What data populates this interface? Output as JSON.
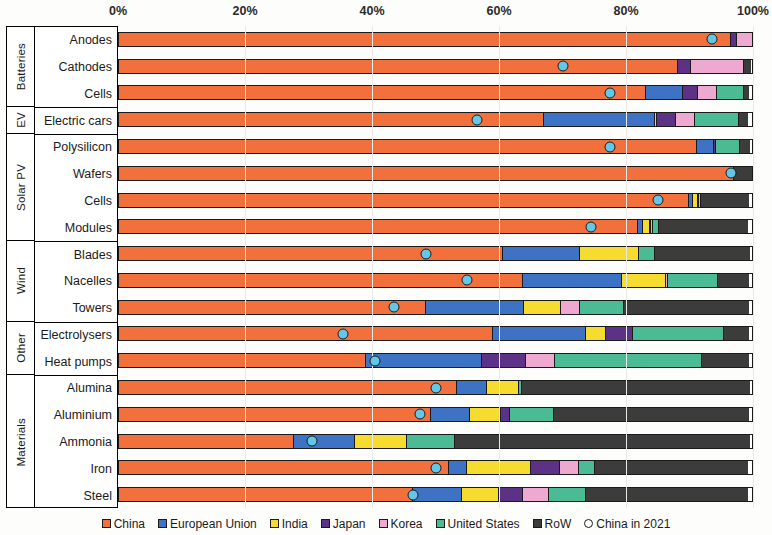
{
  "chart_data": {
    "type": "bar",
    "orientation": "horizontal",
    "stacked": true,
    "title": "",
    "xlabel": "",
    "ylabel": "",
    "xlim": [
      0,
      100
    ],
    "xunit": "%",
    "grid": true,
    "legend_position": "bottom",
    "xticks": [
      "0%",
      "20%",
      "40%",
      "60%",
      "80%",
      "100%"
    ],
    "xtick_values": [
      0,
      20,
      40,
      60,
      80,
      100
    ],
    "series": [
      {
        "name": "China",
        "color": "#F2703C"
      },
      {
        "name": "European Union",
        "color": "#3D72C4"
      },
      {
        "name": "India",
        "color": "#F5DC2E"
      },
      {
        "name": "Japan",
        "color": "#5B3286"
      },
      {
        "name": "Korea",
        "color": "#EDA9D0"
      },
      {
        "name": "United States",
        "color": "#4BBB95"
      },
      {
        "name": "RoW",
        "color": "#3C3C3C"
      }
    ],
    "marker_series": {
      "name": "China in 2021",
      "color": "#63C8E8",
      "shape": "circle"
    },
    "groups": [
      {
        "label": "Batteries",
        "rows": [
          "Anodes",
          "Cathodes",
          "Cells"
        ]
      },
      {
        "label": "EV",
        "rows": [
          "Electric cars"
        ]
      },
      {
        "label": "Solar PV",
        "rows": [
          "Polysilicon",
          "Wafers",
          "Cells",
          "Modules"
        ]
      },
      {
        "label": "Wind",
        "rows": [
          "Blades",
          "Nacelles",
          "Towers"
        ]
      },
      {
        "label": "Other",
        "rows": [
          "Electrolysers",
          "Heat pumps"
        ]
      },
      {
        "label": "Materials",
        "rows": [
          "Alumina",
          "Aluminium",
          "Ammonia",
          "Iron",
          "Steel"
        ]
      }
    ],
    "categories": [
      "Anodes",
      "Cathodes",
      "Cells",
      "Electric cars",
      "Polysilicon",
      "Wafers",
      "Cells",
      "Modules",
      "Blades",
      "Nacelles",
      "Towers",
      "Electrolysers",
      "Heat pumps",
      "Alumina",
      "Aluminium",
      "Ammonia",
      "Iron",
      "Steel"
    ],
    "rows": [
      {
        "group": "Batteries",
        "label": "Anodes",
        "values": {
          "China": 96.4,
          "European Union": 0.0,
          "India": 0.0,
          "Japan": 1.1,
          "Korea": 2.5,
          "United States": 0.0,
          "RoW": 0.0
        },
        "china_2021": 93.5
      },
      {
        "group": "Batteries",
        "label": "Cathodes",
        "values": {
          "China": 88.0,
          "European Union": 0.0,
          "India": 0.0,
          "Japan": 2.2,
          "Korea": 8.5,
          "United States": 0.0,
          "RoW": 1.3
        },
        "china_2021": 70.0
      },
      {
        "group": "Batteries",
        "label": "Cells",
        "values": {
          "China": 83.0,
          "European Union": 6.0,
          "India": 0.0,
          "Japan": 2.5,
          "Korea": 3.2,
          "United States": 4.4,
          "RoW": 0.9
        },
        "china_2021": 77.5
      },
      {
        "group": "EV",
        "label": "Electric cars",
        "values": {
          "China": 67.0,
          "European Union": 17.5,
          "India": 0.6,
          "Japan": 3.1,
          "Korea": 3.1,
          "United States": 7.1,
          "RoW": 1.6
        },
        "china_2021": 56.5
      },
      {
        "group": "Solar PV",
        "label": "Polysilicon",
        "values": {
          "China": 91.0,
          "European Union": 2.8,
          "India": 0.0,
          "Japan": 0.5,
          "Korea": 0.0,
          "United States": 4.0,
          "RoW": 1.7
        },
        "china_2021": 77.5
      },
      {
        "group": "Solar PV",
        "label": "Wafers",
        "values": {
          "China": 97.0,
          "European Union": 0.0,
          "India": 0.0,
          "Japan": 0.0,
          "Korea": 0.0,
          "United States": 0.0,
          "RoW": 3.0
        },
        "china_2021": 96.5
      },
      {
        "group": "Solar PV",
        "label": "Cells",
        "values": {
          "China": 89.8,
          "European Union": 0.7,
          "India": 1.0,
          "Japan": 0.3,
          "Korea": 0.5,
          "United States": 0.0,
          "RoW": 7.7
        },
        "china_2021": 85.0
      },
      {
        "group": "Solar PV",
        "label": "Modules",
        "values": {
          "China": 81.7,
          "European Union": 1.0,
          "India": 1.3,
          "Japan": 0.3,
          "Korea": 0.5,
          "United States": 1.0,
          "RoW": 14.2
        },
        "china_2021": 74.5
      },
      {
        "group": "Wind",
        "label": "Blades",
        "values": {
          "China": 60.5,
          "European Union": 12.3,
          "India": 9.4,
          "United States": 2.7,
          "Japan": 0.0,
          "Korea": 0.0,
          "RoW": 15.1
        },
        "china_2021": 48.5
      },
      {
        "group": "Wind",
        "label": "Nacelles",
        "values": {
          "China": 63.6,
          "European Union": 15.7,
          "India": 7.2,
          "Japan": 0.0,
          "Korea": 0.5,
          "United States": 8.0,
          "RoW": 5.0
        },
        "china_2021": 55.0
      },
      {
        "group": "Wind",
        "label": "Towers",
        "values": {
          "China": 48.3,
          "European Union": 15.6,
          "India": 6.0,
          "Japan": 0.0,
          "Korea": 3.1,
          "United States": 7.2,
          "RoW": 19.8
        },
        "china_2021": 43.5
      },
      {
        "group": "Other",
        "label": "Electrolysers",
        "values": {
          "China": 58.9,
          "European Union": 14.8,
          "India": 3.3,
          "Japan": 4.4,
          "Korea": 0.0,
          "United States": 14.5,
          "RoW": 4.1
        },
        "china_2021": 35.5
      },
      {
        "group": "Other",
        "label": "Heat pumps",
        "values": {
          "China": 38.9,
          "European Union": 18.4,
          "India": 0.0,
          "Japan": 7.1,
          "Korea": 4.7,
          "United States": 23.3,
          "RoW": 7.6
        },
        "china_2021": 40.5
      },
      {
        "group": "Materials",
        "label": "Alumina",
        "values": {
          "China": 53.2,
          "European Union": 4.9,
          "India": 5.2,
          "Japan": 0.0,
          "Korea": 0.0,
          "United States": 0.6,
          "RoW": 36.1
        },
        "china_2021": 50.0
      },
      {
        "group": "Materials",
        "label": "Aluminium",
        "values": {
          "China": 49.1,
          "European Union": 6.3,
          "India": 5.0,
          "Japan": 1.7,
          "Korea": 0.0,
          "United States": 7.1,
          "RoW": 30.8
        },
        "china_2021": 47.5
      },
      {
        "group": "Materials",
        "label": "Ammonia",
        "values": {
          "China": 27.6,
          "European Union": 9.8,
          "India": 8.3,
          "Japan": 0.0,
          "Korea": 0.0,
          "United States": 7.7,
          "RoW": 46.6
        },
        "china_2021": 30.5
      },
      {
        "group": "Materials",
        "label": "Iron",
        "values": {
          "China": 51.9,
          "European Union": 3.1,
          "India": 10.2,
          "Japan": 4.7,
          "Korea": 3.1,
          "United States": 2.7,
          "RoW": 24.3
        },
        "china_2021": 50.0
      },
      {
        "group": "Materials",
        "label": "Steel",
        "values": {
          "China": 46.3,
          "European Union": 7.9,
          "India": 6.0,
          "Japan": 3.9,
          "Korea": 4.3,
          "United States": 6.0,
          "RoW": 25.6
        },
        "china_2021": 46.5
      }
    ]
  },
  "legend": {
    "items": [
      {
        "label": "China",
        "color": "#F2703C",
        "shape": "square"
      },
      {
        "label": "European Union",
        "color": "#3D72C4",
        "shape": "square"
      },
      {
        "label": "India",
        "color": "#F5DC2E",
        "shape": "square"
      },
      {
        "label": "Japan",
        "color": "#5B3286",
        "shape": "square"
      },
      {
        "label": "Korea",
        "color": "#EDA9D0",
        "shape": "square"
      },
      {
        "label": "United States",
        "color": "#4BBB95",
        "shape": "square"
      },
      {
        "label": "RoW",
        "color": "#3C3C3C",
        "shape": "square"
      },
      {
        "label": "China in 2021",
        "color": "#FFFFFF",
        "shape": "circle"
      }
    ]
  }
}
